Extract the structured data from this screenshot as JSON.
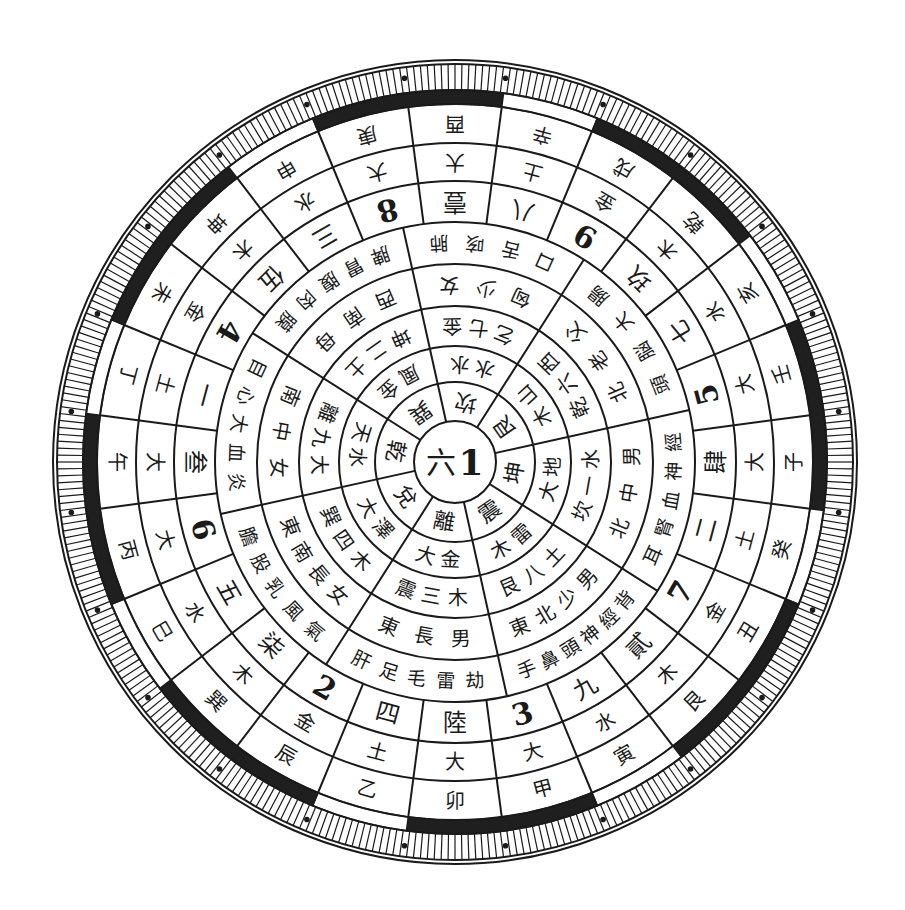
{
  "diagram": {
    "title": "",
    "center": {
      "x": 455,
      "y": 462
    },
    "colors": {
      "ink": "#1a1a1a",
      "paper": "#ffffff",
      "band": "#1f1f1f"
    },
    "hub": {
      "labels": [
        "六",
        "1"
      ]
    },
    "radii": {
      "hub": 41,
      "r1": 80,
      "r2": 116,
      "r3": 156,
      "r4": 198,
      "r5": 240,
      "r6": 281,
      "r7": 319,
      "r8": 358,
      "band_outer": 372,
      "tick_outer": 402
    },
    "inner_start_angle": -102.5,
    "inner_sectors": [
      {
        "trigram": "坎",
        "ring2": [
          "水",
          "水"
        ],
        "ring3": [
          "乞",
          "七",
          "金"
        ],
        "ring4": [
          "匈",
          "少",
          "女"
        ],
        "ring5": [
          "口",
          "舌",
          "咳",
          "肺"
        ]
      },
      {
        "trigram": "艮",
        "ring2": [
          "木",
          "山"
        ],
        "ring3": [
          "乾",
          "六",
          "西"
        ],
        "ring4": [
          "北",
          "老",
          "父"
        ],
        "ring5": [
          "頭",
          "脳",
          "大",
          "腸"
        ]
      },
      {
        "trigram": "坤",
        "ring2": [
          "大",
          "地"
        ],
        "ring3": [
          "坎",
          "一",
          "水"
        ],
        "ring4": [
          "北",
          "中",
          "男"
        ],
        "ring5": [
          "耳",
          "腎",
          "血",
          "神",
          "經"
        ]
      },
      {
        "trigram": "震",
        "ring2": [
          "木",
          "雷"
        ],
        "ring3": [
          "艮",
          "八",
          "土"
        ],
        "ring4": [
          "東",
          "北",
          "少",
          "男"
        ],
        "ring5": [
          "手",
          "鼻",
          "頭",
          "神",
          "經",
          "背"
        ]
      },
      {
        "trigram": "離",
        "ring2": [
          "大",
          "金"
        ],
        "ring3": [
          "震",
          "三",
          "木"
        ],
        "ring4": [
          "東",
          "長",
          "男"
        ],
        "ring5": [
          "肝",
          "足",
          "毛",
          "雷",
          "劫"
        ]
      },
      {
        "trigram": "兌",
        "ring2": [
          "大",
          "澤"
        ],
        "ring3": [
          "巽",
          "四",
          "木"
        ],
        "ring4": [
          "東",
          "南",
          "長",
          "女"
        ],
        "ring5": [
          "膽",
          "股",
          "乳",
          "風",
          "氣"
        ]
      },
      {
        "trigram": "乾",
        "ring2": [
          "天",
          "水"
        ],
        "ring3": [
          "離",
          "九",
          "大"
        ],
        "ring4": [
          "南",
          "中",
          "女"
        ],
        "ring5": [
          "目",
          "心",
          "大",
          "血",
          "炎"
        ]
      },
      {
        "trigram": "巽",
        "ring2": [
          "風",
          "金"
        ],
        "ring3": [
          "坤",
          "二",
          "土"
        ],
        "ring4": [
          "西",
          "南",
          "母"
        ],
        "ring5": [
          "脾",
          "胃",
          "腹",
          "肉",
          "膜"
        ]
      }
    ],
    "outer_start_angle": -7.5,
    "outer_sectors": [
      {
        "branch": "子",
        "element": "大",
        "number": "肆"
      },
      {
        "branch": "癸",
        "element": "土",
        "number": "二"
      },
      {
        "branch": "丑",
        "element": "金",
        "number": "7"
      },
      {
        "branch": "艮",
        "element": "木",
        "number": "貳"
      },
      {
        "branch": "寅",
        "element": "水",
        "number": "九"
      },
      {
        "branch": "甲",
        "element": "大",
        "number": "3"
      },
      {
        "branch": "卯",
        "element": "大",
        "number": "陸"
      },
      {
        "branch": "乙",
        "element": "土",
        "number": "四"
      },
      {
        "branch": "辰",
        "element": "金",
        "number": "2"
      },
      {
        "branch": "巽",
        "element": "木",
        "number": "柒"
      },
      {
        "branch": "巳",
        "element": "水",
        "number": "五"
      },
      {
        "branch": "丙",
        "element": "大",
        "number": "6"
      },
      {
        "branch": "午",
        "element": "大",
        "number": "叁"
      },
      {
        "branch": "丁",
        "element": "土",
        "number": "一"
      },
      {
        "branch": "未",
        "element": "金",
        "number": "4"
      },
      {
        "branch": "坤",
        "element": "木",
        "number": "伍"
      },
      {
        "branch": "申",
        "element": "水",
        "number": "三"
      },
      {
        "branch": "庚",
        "element": "大",
        "number": "8"
      },
      {
        "branch": "酉",
        "element": "大",
        "number": "壹"
      },
      {
        "branch": "辛",
        "element": "土",
        "number": "八"
      },
      {
        "branch": "戌",
        "element": "金",
        "number": "9"
      },
      {
        "branch": "乾",
        "element": "木",
        "number": "玖"
      },
      {
        "branch": "亥",
        "element": "水",
        "number": "七"
      },
      {
        "branch": "壬",
        "element": "大",
        "number": "5"
      }
    ],
    "band_segments": [
      {
        "from": -22.5,
        "to": 7.5,
        "fill": "band"
      },
      {
        "from": 7.5,
        "to": 22.5,
        "fill": "paper"
      },
      {
        "from": 22.5,
        "to": 52.5,
        "fill": "band"
      },
      {
        "from": 52.5,
        "to": 67.5,
        "fill": "paper"
      },
      {
        "from": 67.5,
        "to": 97.5,
        "fill": "band"
      },
      {
        "from": 97.5,
        "to": 112.5,
        "fill": "paper"
      },
      {
        "from": 112.5,
        "to": 142.5,
        "fill": "band"
      },
      {
        "from": 142.5,
        "to": 157.5,
        "fill": "paper"
      },
      {
        "from": 157.5,
        "to": 187.5,
        "fill": "band"
      },
      {
        "from": 187.5,
        "to": 202.5,
        "fill": "paper"
      },
      {
        "from": 202.5,
        "to": 232.5,
        "fill": "band"
      },
      {
        "from": 232.5,
        "to": 247.5,
        "fill": "paper"
      },
      {
        "from": 247.5,
        "to": 277.5,
        "fill": "band"
      },
      {
        "from": 277.5,
        "to": 292.5,
        "fill": "paper"
      },
      {
        "from": 292.5,
        "to": 322.5,
        "fill": "band"
      },
      {
        "from": 322.5,
        "to": 337.5,
        "fill": "paper"
      }
    ],
    "tick_count": 360,
    "dot_count": 24
  }
}
